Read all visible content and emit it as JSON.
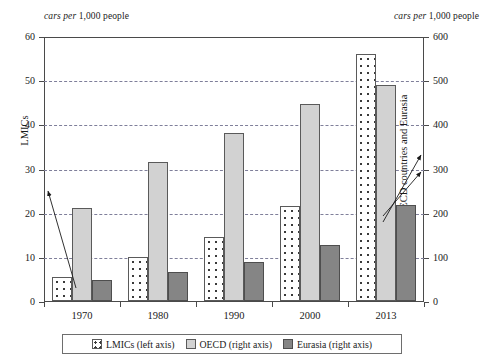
{
  "units": {
    "left_italic": "cars per",
    "left_rest": " 1,000 people",
    "right_italic": "cars per",
    "right_rest": " 1,000 people"
  },
  "axes": {
    "left_title": "LMICs",
    "right_title": "OECD countries and Eurasia",
    "left_ticks": [
      "0",
      "10",
      "20",
      "30",
      "40",
      "50",
      "60"
    ],
    "right_ticks": [
      "0",
      "100",
      "200",
      "300",
      "400",
      "500",
      "600"
    ]
  },
  "legend": {
    "items": [
      {
        "label": "LMICs (left axis)",
        "key": "lmics",
        "color": "#ffffff"
      },
      {
        "label": "OECD (right axis)",
        "key": "oecd",
        "color": "#d2d2d2"
      },
      {
        "label": "Eurasia (right axis)",
        "key": "eurasia",
        "color": "#858585"
      }
    ]
  },
  "chart_data": {
    "type": "bar",
    "title": "",
    "subtitle": "",
    "xlabel": "",
    "ylabel": "LMICs",
    "ylabel_secondary": "OECD countries and Eurasia",
    "unit_label": "cars per 1,000 people",
    "categories": [
      "1970",
      "1980",
      "1990",
      "2000",
      "2013"
    ],
    "series": [
      {
        "name": "LMICs (left axis)",
        "axis": "left",
        "color": "#ffffff",
        "pattern": "dotted",
        "values": [
          5.5,
          10.0,
          14.5,
          21.5,
          56.0
        ]
      },
      {
        "name": "OECD (right axis)",
        "axis": "right",
        "color": "#d2d2d2",
        "pattern": "solid",
        "values": [
          210,
          315,
          380,
          445,
          490
        ]
      },
      {
        "name": "Eurasia (right axis)",
        "axis": "right",
        "color": "#858585",
        "pattern": "solid",
        "values": [
          48,
          65,
          88,
          127,
          218
        ]
      }
    ],
    "ylim": [
      0,
      60
    ],
    "ylim_secondary": [
      0,
      600
    ],
    "ytick_step": 10,
    "ytick_step_secondary": 100,
    "grid": true,
    "grid_style": "dashed-horizontal",
    "legend_position": "bottom",
    "annotations": [
      {
        "name": "lmics-axis-pointer",
        "points_from": "1970 LMICs bar",
        "points_to": "left axis near 21"
      },
      {
        "name": "oecd-axis-pointer",
        "points_from": "2013 OECD bar",
        "points_to": "right axis near 310"
      },
      {
        "name": "eurasia-axis-pointer",
        "points_from": "2013 Eurasia bar",
        "points_to": "right axis near 285"
      }
    ]
  }
}
